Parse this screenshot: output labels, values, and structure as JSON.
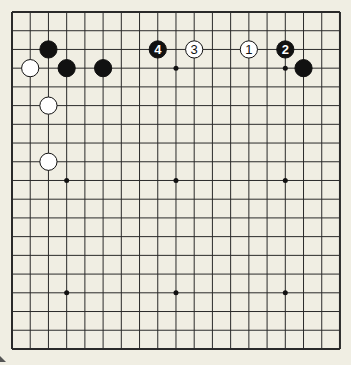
{
  "board": {
    "size": 19,
    "origin_x": 12,
    "origin_y": 12,
    "spacing_x": 18.22,
    "spacing_y": 18.72,
    "background": "#f0eee3",
    "line_color": "#2a2a2a",
    "hoshi": [
      [
        3,
        9
      ],
      [
        9,
        9
      ],
      [
        15,
        9
      ],
      [
        3,
        15
      ],
      [
        9,
        15
      ],
      [
        15,
        15
      ],
      [
        9,
        3
      ],
      [
        15,
        3
      ]
    ]
  },
  "stones": [
    {
      "color": "black",
      "col": 2,
      "row": 2,
      "label": ""
    },
    {
      "color": "white",
      "col": 1,
      "row": 3,
      "label": ""
    },
    {
      "color": "black",
      "col": 3,
      "row": 3,
      "label": ""
    },
    {
      "color": "black",
      "col": 5,
      "row": 3,
      "label": ""
    },
    {
      "color": "white",
      "col": 2,
      "row": 5,
      "label": ""
    },
    {
      "color": "white",
      "col": 2,
      "row": 8,
      "label": ""
    },
    {
      "color": "black",
      "col": 8,
      "row": 2,
      "label": "4"
    },
    {
      "color": "white",
      "col": 10,
      "row": 2,
      "label": "3"
    },
    {
      "color": "white",
      "col": 13,
      "row": 2,
      "label": "1"
    },
    {
      "color": "black",
      "col": 15,
      "row": 2,
      "label": "2"
    },
    {
      "color": "black",
      "col": 16,
      "row": 3,
      "label": ""
    }
  ]
}
